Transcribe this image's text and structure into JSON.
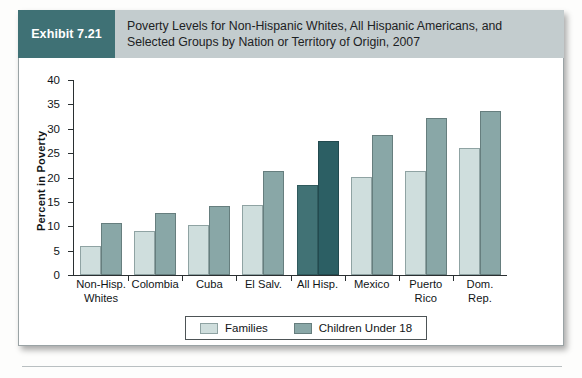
{
  "exhibit": {
    "badge_label": "Exhibit 7.21",
    "title_line1": "Poverty Levels for Non-Hispanic Whites, All Hispanic Americans, and",
    "title_line2": "Selected Groups by Nation or Territory of Origin, 2007",
    "badge_color": "#3f7175",
    "band_color": "#c3ccce"
  },
  "legend": {
    "families_label": "Families",
    "children_label": "Children Under 18"
  },
  "chart_data": {
    "type": "bar",
    "title": "Poverty Levels for Non-Hispanic Whites, All Hispanic Americans, and Selected Groups by Nation or Territory of Origin, 2007",
    "xlabel": "",
    "ylabel": "Percent in Poverty",
    "ylim": [
      0,
      40
    ],
    "yticks": [
      0,
      5,
      10,
      15,
      20,
      25,
      30,
      35,
      40
    ],
    "grid": false,
    "legend_position": "bottom-center",
    "categories": [
      "Non-Hisp. Whites",
      "Colombia",
      "Cuba",
      "El Salv.",
      "All Hisp.",
      "Mexico",
      "Puerto Rico",
      "Dom. Rep."
    ],
    "category_lines": [
      [
        "Non-Hisp.",
        "Whites"
      ],
      [
        "Colombia",
        ""
      ],
      [
        "Cuba",
        ""
      ],
      [
        "El Salv.",
        ""
      ],
      [
        "All Hisp.",
        ""
      ],
      [
        "Mexico",
        ""
      ],
      [
        "Puerto",
        "Rico"
      ],
      [
        "Dom.",
        "Rep."
      ]
    ],
    "series": [
      {
        "name": "Families",
        "color": "#cfdedd",
        "highlight_color": "#417275",
        "values": [
          6.0,
          9.0,
          10.2,
          14.3,
          18.5,
          20.1,
          21.3,
          26.0
        ]
      },
      {
        "name": "Children Under 18",
        "color": "#89a7a7",
        "highlight_color": "#2c5f64",
        "values": [
          10.6,
          12.8,
          14.1,
          21.4,
          27.5,
          28.8,
          32.3,
          33.6
        ]
      }
    ],
    "highlight_category_index": 4
  }
}
